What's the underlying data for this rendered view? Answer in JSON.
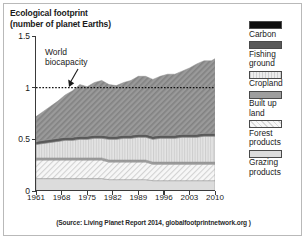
{
  "title": "Ecological footprint\n(number of planet Earths)",
  "source": "(Source: Living Planet Report 2014, globalfootprintnetwork.org )",
  "annotation": {
    "label": "World\nbiocapacity",
    "arrow_icon": "down-left-arrow-icon"
  },
  "legend": {
    "items": [
      {
        "label": "Carbon",
        "color": "#0d0d0d",
        "pattern": "solid"
      },
      {
        "label": "Fishing\nground",
        "color": "#595959",
        "pattern": "solid"
      },
      {
        "label": "Cropland",
        "color": "#d9d9d9",
        "pattern": "vertical-lines"
      },
      {
        "label": "Built up\nland",
        "color": "#9e9e9e",
        "pattern": "solid"
      },
      {
        "label": "Forest\nproducts",
        "color": "#f2f2f2",
        "pattern": "diagonal-hatch"
      },
      {
        "label": "Grazing\nproducts",
        "color": "#dcdcdc",
        "pattern": "solid"
      }
    ]
  },
  "chart_data": {
    "type": "area",
    "stacked": true,
    "title": "Ecological footprint (number of planet Earths)",
    "xlabel": "",
    "ylabel": "number of planet Earths",
    "xlim": [
      1961,
      2010
    ],
    "ylim": [
      0,
      1.5
    ],
    "yticks": [
      0,
      0.5,
      1,
      1.5
    ],
    "ytick_labels": [
      "0",
      "0.5",
      "1",
      "1.5"
    ],
    "xticks": [
      1961,
      1968,
      1975,
      1982,
      1989,
      1996,
      2003,
      2010
    ],
    "xtick_labels": [
      "1961",
      "1968",
      "1975",
      "1982",
      "1989",
      "1996",
      "2003",
      "2010"
    ],
    "grid": false,
    "legend_position": "right",
    "reference_line": {
      "label": "World biocapacity",
      "y": 1.0,
      "style": "dotted"
    },
    "x": [
      1961,
      1963,
      1965,
      1967,
      1969,
      1971,
      1973,
      1975,
      1977,
      1979,
      1981,
      1983,
      1985,
      1987,
      1989,
      1991,
      1993,
      1995,
      1997,
      1999,
      2001,
      2003,
      2005,
      2007,
      2009,
      2010
    ],
    "series": [
      {
        "name": "Grazing products",
        "color": "#dcdcdc",
        "pattern": "solid",
        "values": [
          0.12,
          0.12,
          0.12,
          0.12,
          0.12,
          0.12,
          0.12,
          0.12,
          0.12,
          0.12,
          0.11,
          0.11,
          0.11,
          0.11,
          0.11,
          0.11,
          0.1,
          0.1,
          0.1,
          0.1,
          0.1,
          0.1,
          0.1,
          0.1,
          0.1,
          0.1
        ]
      },
      {
        "name": "Forest products",
        "color": "#f2f2f2",
        "pattern": "diagonal-hatch",
        "values": [
          0.18,
          0.18,
          0.18,
          0.18,
          0.18,
          0.18,
          0.18,
          0.18,
          0.18,
          0.18,
          0.17,
          0.17,
          0.17,
          0.17,
          0.17,
          0.17,
          0.16,
          0.16,
          0.16,
          0.16,
          0.16,
          0.16,
          0.16,
          0.16,
          0.16,
          0.16
        ]
      },
      {
        "name": "Built up land",
        "color": "#9e9e9e",
        "pattern": "solid",
        "values": [
          0.02,
          0.02,
          0.02,
          0.02,
          0.02,
          0.02,
          0.02,
          0.02,
          0.02,
          0.02,
          0.02,
          0.02,
          0.02,
          0.02,
          0.02,
          0.02,
          0.02,
          0.02,
          0.02,
          0.02,
          0.02,
          0.02,
          0.02,
          0.02,
          0.02,
          0.02
        ]
      },
      {
        "name": "Cropland",
        "color": "#d9d9d9",
        "pattern": "vertical-lines",
        "values": [
          0.13,
          0.14,
          0.15,
          0.16,
          0.17,
          0.17,
          0.18,
          0.18,
          0.19,
          0.19,
          0.2,
          0.2,
          0.21,
          0.21,
          0.22,
          0.22,
          0.22,
          0.23,
          0.23,
          0.23,
          0.24,
          0.24,
          0.24,
          0.25,
          0.25,
          0.25
        ]
      },
      {
        "name": "Fishing ground",
        "color": "#595959",
        "pattern": "solid",
        "values": [
          0.03,
          0.03,
          0.03,
          0.03,
          0.03,
          0.03,
          0.03,
          0.03,
          0.03,
          0.03,
          0.03,
          0.03,
          0.03,
          0.03,
          0.03,
          0.03,
          0.03,
          0.03,
          0.03,
          0.03,
          0.03,
          0.03,
          0.03,
          0.03,
          0.03,
          0.03
        ]
      },
      {
        "name": "Carbon",
        "color": "#8c8c8c",
        "pattern": "diagonal-hatch-dark",
        "values": [
          0.24,
          0.28,
          0.32,
          0.36,
          0.41,
          0.45,
          0.5,
          0.48,
          0.51,
          0.53,
          0.5,
          0.49,
          0.51,
          0.53,
          0.56,
          0.56,
          0.55,
          0.57,
          0.59,
          0.59,
          0.61,
          0.64,
          0.68,
          0.7,
          0.7,
          0.72
        ]
      }
    ],
    "totals": [
      0.72,
      0.77,
      0.82,
      0.87,
      0.93,
      0.97,
      1.03,
      1.01,
      1.05,
      1.07,
      1.03,
      1.02,
      1.05,
      1.07,
      1.11,
      1.11,
      1.08,
      1.11,
      1.13,
      1.13,
      1.16,
      1.19,
      1.23,
      1.26,
      1.26,
      1.28
    ]
  }
}
